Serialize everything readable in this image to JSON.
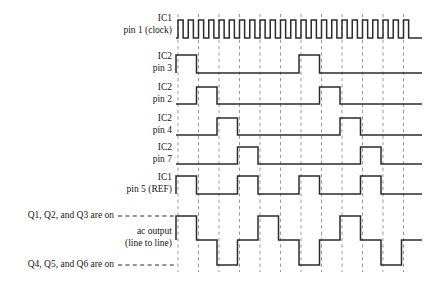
{
  "figure": {
    "background_color": "#ffffff",
    "wave_color": "#2b2b2b",
    "grid_color": "#8c8c8c"
  },
  "geometry": {
    "plot_left": 176,
    "plot_right": 422,
    "grid_start": 178,
    "period_px": 20.5,
    "grid_count": 12
  },
  "rows": [
    {
      "id": "ic1-pin1-clock",
      "label_line1": "IC1",
      "label_line2": "pin 1 (clock)",
      "label_y1": 19,
      "label_y2": 31,
      "baseline_y": 38,
      "high_y": 20,
      "type": "clock",
      "period_units": 0.5,
      "duty": 0.5
    },
    {
      "id": "ic2-pin3",
      "label_line1": "IC2",
      "label_line2": "pin 3",
      "label_y1": 57,
      "label_y2": 69,
      "baseline_y": 73,
      "high_y": 55,
      "type": "pulse",
      "offset_units": 0,
      "high_units": 1,
      "period_units": 6
    },
    {
      "id": "ic2-pin2",
      "label_line1": "IC2",
      "label_line2": "pin 2",
      "label_y1": 88,
      "label_y2": 100,
      "baseline_y": 104,
      "high_y": 87,
      "type": "pulse",
      "offset_units": 1,
      "high_units": 1,
      "period_units": 6
    },
    {
      "id": "ic2-pin4",
      "label_line1": "IC2",
      "label_line2": "pin 4",
      "label_y1": 119,
      "label_y2": 131,
      "baseline_y": 135,
      "high_y": 118,
      "type": "pulse",
      "offset_units": 2,
      "high_units": 1,
      "period_units": 6
    },
    {
      "id": "ic2-pin7",
      "label_line1": "IC2",
      "label_line2": "pin 7",
      "label_y1": 148,
      "label_y2": 160,
      "baseline_y": 164,
      "high_y": 147,
      "type": "pulse",
      "offset_units": 3,
      "high_units": 1,
      "period_units": 6
    },
    {
      "id": "ic1-pin5-ref",
      "label_line1": "IC1",
      "label_line2": "pin 5 (REF)",
      "label_y1": 178,
      "label_y2": 190,
      "baseline_y": 194,
      "high_y": 176,
      "type": "pulse",
      "offset_units": 0,
      "high_units": 1,
      "period_units": 3
    }
  ],
  "output_row": {
    "id": "ac-output",
    "label_line1": "ac output",
    "label_line2": "(line to line)",
    "label_y1": 232,
    "label_y2": 244,
    "high_y": 216,
    "mid_y": 240,
    "low_y": 265,
    "levels_per_unit": [
      "high",
      "mid",
      "low",
      "mid"
    ],
    "start_level": "mid",
    "start_offset_units": 0
  },
  "annotations": [
    {
      "id": "upper-on-note",
      "text": "Q1, Q2, and Q3 are on",
      "text_y": 216,
      "dash_y": 216,
      "dash_x1": 118,
      "dash_x2": 176,
      "text_x": 114
    },
    {
      "id": "lower-on-note",
      "text": "Q4, Q5, and Q6 are on",
      "text_y": 265,
      "dash_y": 265,
      "dash_x1": 118,
      "dash_x2": 176,
      "text_x": 114
    }
  ],
  "label_x": 172,
  "grid_top": 14,
  "grid_bottom": 272
}
